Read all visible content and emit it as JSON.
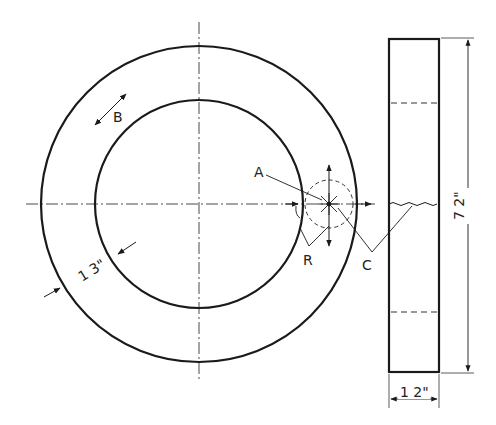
{
  "drawing": {
    "title": "Grinding wheel — front and side views",
    "front_view": {
      "labels": {
        "a": "A",
        "b": "B",
        "r": "R",
        "c": "C"
      },
      "dimension_radial": "1 3\""
    },
    "side_view": {
      "dimension_height": "7 2\"",
      "dimension_width": "1 2\""
    },
    "colors": {
      "line": "#1a1a1a",
      "background": "#ffffff"
    }
  }
}
